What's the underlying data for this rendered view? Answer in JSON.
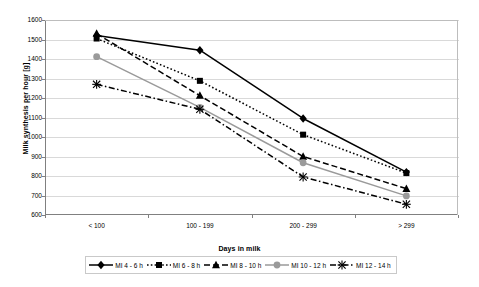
{
  "chart_data": {
    "type": "line",
    "title": "",
    "xlabel": "Days in milk",
    "ylabel": "Milk synthesis per hour [g]",
    "categories": [
      "< 100",
      "100 - 199",
      "200 - 299",
      "> 299"
    ],
    "ylim": [
      600,
      1600
    ],
    "yticks": [
      600,
      700,
      800,
      900,
      1000,
      1100,
      1200,
      1300,
      1400,
      1500,
      1600
    ],
    "grid": "horizontal",
    "legend_position": "bottom",
    "series": [
      {
        "name": "MI 4 - 6 h",
        "values": [
          1520,
          1445,
          1095,
          820
        ],
        "color": "#000000",
        "line_style": "solid",
        "marker": "diamond"
      },
      {
        "name": "MI 6 - 8 h",
        "values": [
          1505,
          1288,
          1012,
          815
        ],
        "color": "#000000",
        "line_style": "dotted",
        "marker": "square"
      },
      {
        "name": "MI 8 - 10 h",
        "values": [
          1530,
          1212,
          900,
          735
        ],
        "color": "#000000",
        "line_style": "dashed",
        "marker": "triangle"
      },
      {
        "name": "MI 10 - 12 h",
        "values": [
          1412,
          1152,
          868,
          698
        ],
        "color": "#9a9a9a",
        "line_style": "solid",
        "marker": "circle"
      },
      {
        "name": "MI 12 - 14 h",
        "values": [
          1270,
          1142,
          795,
          655
        ],
        "color": "#000000",
        "line_style": "dashdot",
        "marker": "x"
      }
    ]
  },
  "axes": {
    "y_title": "Milk synthesis per hour [g]",
    "x_title": "Days in milk"
  },
  "colors": {
    "grid": "#d9d9d9",
    "axis": "#808080",
    "gray_series": "#9a9a9a",
    "black_series": "#000000",
    "legend_border": "#c9c9c9"
  }
}
